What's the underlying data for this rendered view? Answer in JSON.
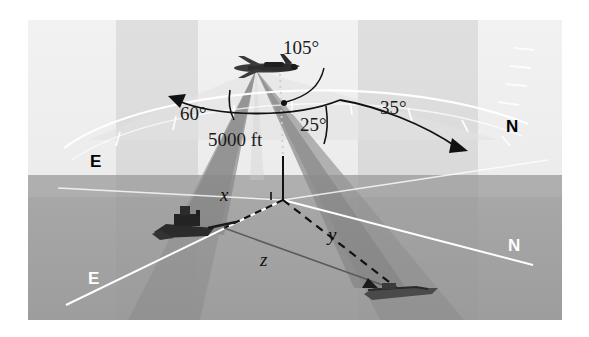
{
  "figure": {
    "type": "technical-illustration",
    "altitude_label": "5000 ft",
    "angles": [
      {
        "name": "angle-105",
        "value": "105°"
      },
      {
        "name": "angle-60",
        "value": "60°"
      },
      {
        "name": "angle-25",
        "value": "25°"
      },
      {
        "name": "angle-35",
        "value": "35°"
      }
    ],
    "distance_labels": [
      {
        "name": "distance-x",
        "value": "x"
      },
      {
        "name": "distance-y",
        "value": "y"
      },
      {
        "name": "distance-z",
        "value": "z"
      }
    ],
    "compass_labels": [
      {
        "name": "compass-north-upper",
        "value": "N",
        "style": "dark"
      },
      {
        "name": "compass-east-upper",
        "value": "E",
        "style": "dark"
      },
      {
        "name": "compass-north-lower",
        "value": "N",
        "style": "light"
      },
      {
        "name": "compass-east-lower",
        "value": "E",
        "style": "light"
      }
    ],
    "objects": [
      {
        "name": "aircraft",
        "kind": "airplane"
      },
      {
        "name": "ship-left",
        "kind": "ship"
      },
      {
        "name": "boat-right",
        "kind": "boat"
      }
    ]
  },
  "colors": {
    "sky": "#f0f0f0",
    "ground": "#a4a4a4",
    "wedge": "#8e8e8e",
    "axis_line": "#ffffff",
    "ink": "#1a1a1a"
  }
}
